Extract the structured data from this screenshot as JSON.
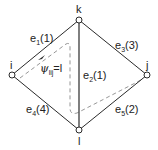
{
  "diagram": {
    "colors": {
      "line": "#2a2a2a",
      "dashed": "#8a8a8a",
      "node_fill": "#ffffff"
    },
    "nodes": [
      {
        "id": "k",
        "label": "k",
        "x": 79,
        "y": 20
      },
      {
        "id": "i",
        "label": "i",
        "x": 12,
        "y": 75
      },
      {
        "id": "j",
        "label": "j",
        "x": 147,
        "y": 75
      },
      {
        "id": "l",
        "label": "l",
        "x": 79,
        "y": 130
      }
    ],
    "edges": [
      {
        "id": "e1",
        "from": "i",
        "to": "k",
        "name": "e",
        "sub": "1",
        "weight": "(1)"
      },
      {
        "id": "e2",
        "from": "k",
        "to": "l",
        "name": "e",
        "sub": "2",
        "weight": "(1)"
      },
      {
        "id": "e3",
        "from": "k",
        "to": "j",
        "name": "e",
        "sub": "3",
        "weight": "(3)"
      },
      {
        "id": "e4",
        "from": "i",
        "to": "l",
        "name": "e",
        "sub": "4",
        "weight": "(4)"
      },
      {
        "id": "e5",
        "from": "l",
        "to": "j",
        "name": "e",
        "sub": "5",
        "weight": "(2)"
      }
    ],
    "path_label": {
      "symbol": "ψ",
      "sub": "lij",
      "value": "=l"
    }
  }
}
